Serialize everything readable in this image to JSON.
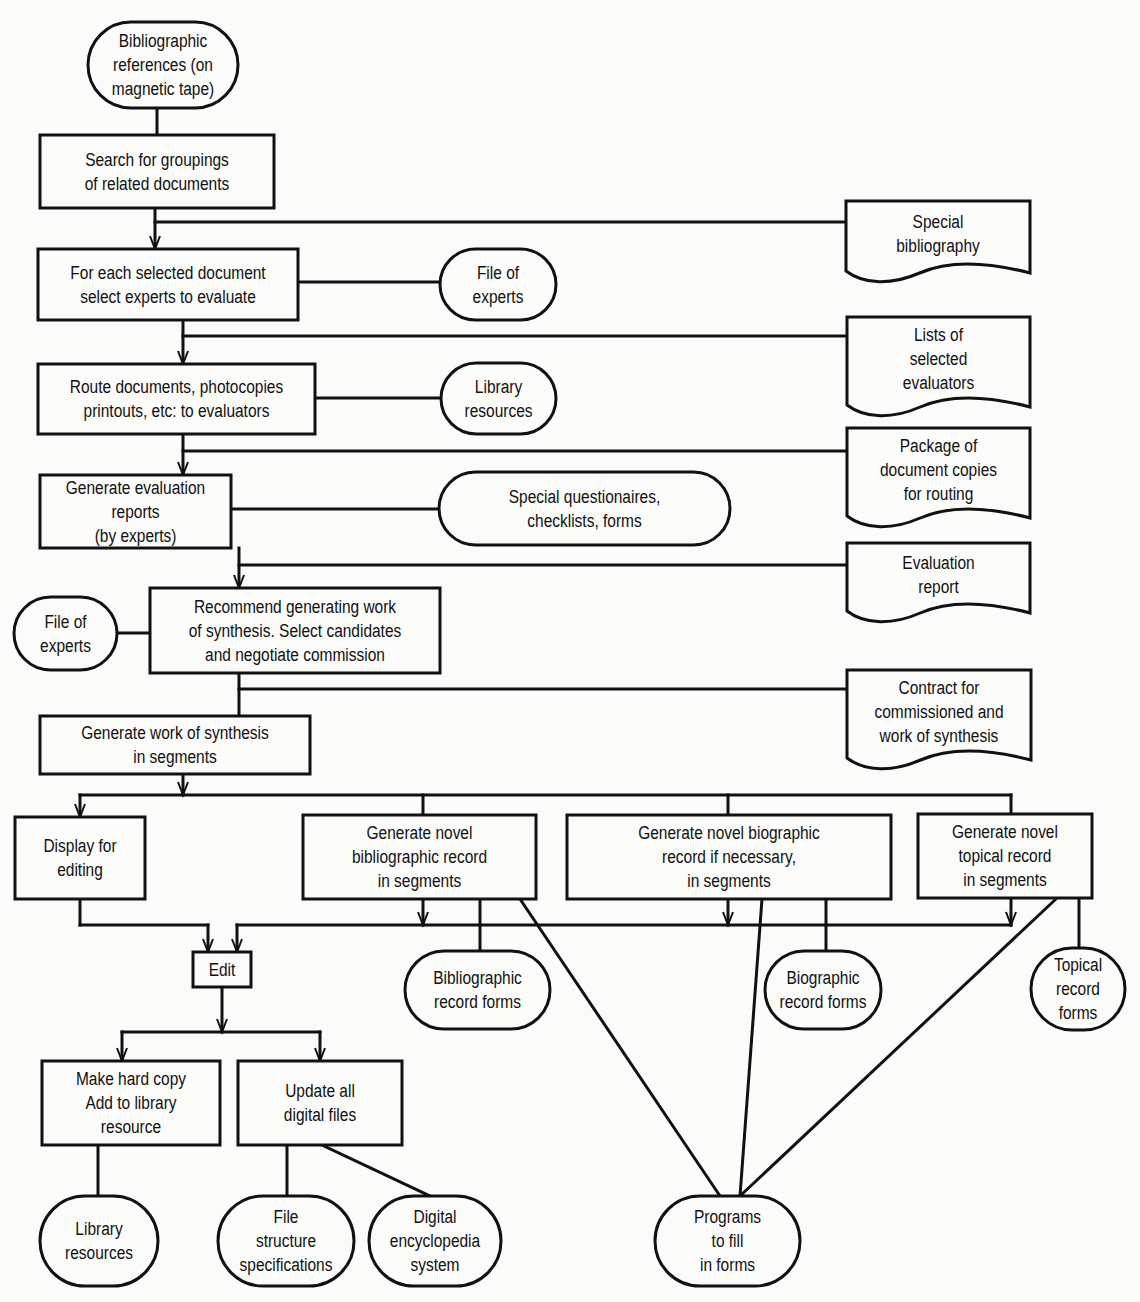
{
  "diagram": {
    "colors": {
      "ink": "#111111",
      "paper": "#fbfbf9"
    },
    "nodes": [
      {
        "id": "bib_refs",
        "shape": "terminal",
        "x": 88,
        "y": 22,
        "w": 150,
        "h": 86,
        "text": "Bibliographic\nreferences (on\nmagnetic tape)"
      },
      {
        "id": "search",
        "shape": "process",
        "x": 40,
        "y": 135,
        "w": 234,
        "h": 73,
        "text": "Search for groupings\nof related documents"
      },
      {
        "id": "special_bib",
        "shape": "document",
        "x": 846,
        "y": 201,
        "w": 184,
        "h": 72,
        "text": "Special\nbibliography"
      },
      {
        "id": "select_experts",
        "shape": "process",
        "x": 38,
        "y": 249,
        "w": 260,
        "h": 71,
        "text": "For each selected document\nselect experts to evaluate"
      },
      {
        "id": "file_experts_1",
        "shape": "terminal",
        "x": 440,
        "y": 249,
        "w": 116,
        "h": 71,
        "text": "File of\nexperts"
      },
      {
        "id": "lists_evaluators",
        "shape": "document",
        "x": 847,
        "y": 317,
        "w": 183,
        "h": 90,
        "text": "Lists of\nselected\nevaluators"
      },
      {
        "id": "route_docs",
        "shape": "process",
        "x": 38,
        "y": 364,
        "w": 277,
        "h": 70,
        "text": "Route documents, photocopies\nprintouts, etc: to evaluators"
      },
      {
        "id": "library_res_1",
        "shape": "terminal",
        "x": 441,
        "y": 363,
        "w": 115,
        "h": 71,
        "text": "Library\nresources"
      },
      {
        "id": "package_docs",
        "shape": "document",
        "x": 847,
        "y": 428,
        "w": 183,
        "h": 90,
        "text": "Package of\ndocument copies\nfor routing"
      },
      {
        "id": "gen_eval_reports",
        "shape": "process",
        "x": 40,
        "y": 475,
        "w": 191,
        "h": 73,
        "text": "Generate evaluation reports\n(by experts)"
      },
      {
        "id": "special_quest",
        "shape": "terminal",
        "x": 439,
        "y": 472,
        "w": 291,
        "h": 73,
        "text": "Special questionaires,\nchecklists, forms"
      },
      {
        "id": "eval_report",
        "shape": "document",
        "x": 847,
        "y": 543,
        "w": 183,
        "h": 70,
        "text": "Evaluation\nreport"
      },
      {
        "id": "file_experts_2",
        "shape": "terminal",
        "x": 14,
        "y": 597,
        "w": 103,
        "h": 73,
        "text": "File of\nexperts"
      },
      {
        "id": "recommend",
        "shape": "process",
        "x": 150,
        "y": 588,
        "w": 290,
        "h": 85,
        "text": "Recommend generating work\nof synthesis. Select candidates\nand negotiate commission"
      },
      {
        "id": "contract",
        "shape": "document",
        "x": 847,
        "y": 670,
        "w": 184,
        "h": 90,
        "text": "Contract for\ncommissioned and\nwork of synthesis"
      },
      {
        "id": "gen_synthesis",
        "shape": "process",
        "x": 40,
        "y": 716,
        "w": 270,
        "h": 58,
        "text": "Generate work of synthesis\nin segments"
      },
      {
        "id": "display_edit",
        "shape": "process",
        "x": 15,
        "y": 817,
        "w": 130,
        "h": 82,
        "text": "Display for\nediting"
      },
      {
        "id": "gen_bib_record",
        "shape": "process",
        "x": 303,
        "y": 815,
        "w": 233,
        "h": 84,
        "text": "Generate novel\nbibliographic record\nin segments"
      },
      {
        "id": "gen_bio_record",
        "shape": "process",
        "x": 567,
        "y": 815,
        "w": 324,
        "h": 84,
        "text": "Generate novel biographic\nrecord if necessary,\nin segments"
      },
      {
        "id": "gen_topical_record",
        "shape": "process",
        "x": 918,
        "y": 814,
        "w": 174,
        "h": 84,
        "text": "Generate novel\ntopical record\nin segments"
      },
      {
        "id": "edit",
        "shape": "process",
        "x": 193,
        "y": 952,
        "w": 58,
        "h": 35,
        "text": "Edit"
      },
      {
        "id": "bib_record_forms",
        "shape": "terminal",
        "x": 405,
        "y": 951,
        "w": 145,
        "h": 78,
        "text": "Bibliographic\nrecord forms"
      },
      {
        "id": "bio_record_forms",
        "shape": "terminal",
        "x": 765,
        "y": 951,
        "w": 116,
        "h": 78,
        "text": "Biographic\nrecord forms"
      },
      {
        "id": "topical_record_forms",
        "shape": "terminal",
        "x": 1031,
        "y": 948,
        "w": 94,
        "h": 82,
        "text": "Topical\nrecord\nforms"
      },
      {
        "id": "hard_copy",
        "shape": "process",
        "x": 42,
        "y": 1061,
        "w": 178,
        "h": 84,
        "text": "Make hard copy\nAdd to library\nresource"
      },
      {
        "id": "update_files",
        "shape": "process",
        "x": 238,
        "y": 1061,
        "w": 164,
        "h": 84,
        "text": "Update all\ndigital files"
      },
      {
        "id": "library_res_2",
        "shape": "terminal",
        "x": 40,
        "y": 1196,
        "w": 118,
        "h": 90,
        "text": "Library\nresources"
      },
      {
        "id": "file_struct",
        "shape": "terminal",
        "x": 218,
        "y": 1196,
        "w": 136,
        "h": 90,
        "text": "File\nstructure\nspecifications"
      },
      {
        "id": "digital_encyc",
        "shape": "terminal",
        "x": 369,
        "y": 1196,
        "w": 132,
        "h": 90,
        "text": "Digital\nencyclopedia\nsystem"
      },
      {
        "id": "programs_forms",
        "shape": "terminal",
        "x": 655,
        "y": 1196,
        "w": 145,
        "h": 90,
        "text": "Programs\nto fill\nin forms"
      }
    ],
    "lines": [
      [
        157,
        108,
        157,
        135
      ],
      [
        155,
        208,
        155,
        249
      ],
      [
        155,
        222,
        847,
        222
      ],
      [
        298,
        282,
        440,
        282
      ],
      [
        183,
        320,
        183,
        364
      ],
      [
        183,
        336,
        848,
        336
      ],
      [
        315,
        398,
        441,
        398
      ],
      [
        183,
        434,
        183,
        475
      ],
      [
        183,
        451,
        848,
        451
      ],
      [
        231,
        509,
        439,
        509
      ],
      [
        239,
        548,
        239,
        588
      ],
      [
        239,
        565,
        848,
        565
      ],
      [
        117,
        633,
        150,
        633
      ],
      [
        239,
        673,
        239,
        716
      ],
      [
        239,
        689,
        848,
        689
      ],
      [
        183,
        774,
        183,
        795
      ],
      [
        80,
        795,
        1011,
        795
      ],
      [
        80,
        795,
        80,
        817
      ],
      [
        423,
        795,
        423,
        815
      ],
      [
        728,
        795,
        728,
        815
      ],
      [
        1011,
        795,
        1011,
        814
      ],
      [
        80,
        899,
        80,
        925
      ],
      [
        80,
        925,
        208,
        925
      ],
      [
        208,
        925,
        208,
        952
      ],
      [
        237,
        925,
        1011,
        925
      ],
      [
        237,
        925,
        237,
        952
      ],
      [
        423,
        899,
        423,
        925
      ],
      [
        728,
        899,
        728,
        925
      ],
      [
        1011,
        898,
        1011,
        925
      ],
      [
        480,
        899,
        480,
        951
      ],
      [
        826,
        899,
        826,
        951
      ],
      [
        1079,
        898,
        1079,
        948
      ],
      [
        520,
        899,
        720,
        1196
      ],
      [
        762,
        899,
        740,
        1196
      ],
      [
        1057,
        898,
        740,
        1196
      ],
      [
        222,
        987,
        222,
        1032
      ],
      [
        122,
        1032,
        320,
        1032
      ],
      [
        122,
        1032,
        122,
        1061
      ],
      [
        320,
        1032,
        320,
        1061
      ],
      [
        98,
        1145,
        98,
        1196
      ],
      [
        287,
        1145,
        287,
        1196
      ],
      [
        322,
        1145,
        430,
        1196
      ]
    ],
    "arrows": [
      [
        155,
        249
      ],
      [
        183,
        364
      ],
      [
        183,
        475
      ],
      [
        239,
        588
      ],
      [
        183,
        795
      ],
      [
        80,
        817
      ],
      [
        208,
        952
      ],
      [
        237,
        952
      ],
      [
        423,
        925
      ],
      [
        728,
        925
      ],
      [
        1011,
        925
      ],
      [
        222,
        1032
      ],
      [
        122,
        1061
      ],
      [
        320,
        1061
      ]
    ]
  }
}
